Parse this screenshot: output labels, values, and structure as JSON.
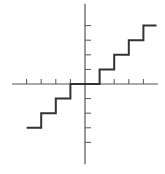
{
  "figure": {
    "type": "step-function-graph"
  },
  "colors": {
    "background": "#ffffff",
    "axis": "#555555",
    "curve": "#333333"
  },
  "axes": {
    "origin_px": [
      85,
      84
    ],
    "unit_px": 14.6,
    "x_range": [
      -5,
      5
    ],
    "y_range": [
      -5.5,
      5.5
    ],
    "x_ticks": [
      -4,
      -3,
      -2,
      -1,
      1,
      2,
      3,
      4
    ],
    "y_ticks": [
      -4,
      -3,
      -2,
      -1,
      1,
      2,
      3,
      4
    ]
  },
  "chart_data": {
    "type": "line",
    "title": "",
    "xlabel": "",
    "ylabel": "",
    "grid": false,
    "series": [
      {
        "name": "step function",
        "points": [
          [
            -4,
            -3
          ],
          [
            -3,
            -3
          ],
          [
            -3,
            -2
          ],
          [
            -2,
            -2
          ],
          [
            -2,
            -1
          ],
          [
            -1,
            -1
          ],
          [
            -1,
            0
          ],
          [
            1,
            0
          ],
          [
            1,
            1
          ],
          [
            2,
            1
          ],
          [
            2,
            2
          ],
          [
            3,
            2
          ],
          [
            3,
            3
          ],
          [
            4,
            3
          ],
          [
            4,
            4
          ],
          [
            4.9,
            4
          ]
        ]
      }
    ]
  }
}
